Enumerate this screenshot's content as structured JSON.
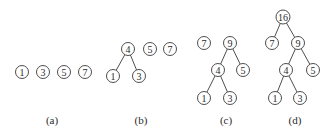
{
  "figure": {
    "panels": [
      {
        "id": "a",
        "caption": "(a)",
        "caption_pos": [
          52,
          124
        ],
        "nodes": [
          {
            "id": "a1",
            "label": "1",
            "x": 22,
            "y": 72
          },
          {
            "id": "a3",
            "label": "3",
            "x": 43,
            "y": 72
          },
          {
            "id": "a5",
            "label": "5",
            "x": 64,
            "y": 72
          },
          {
            "id": "a7",
            "label": "7",
            "x": 85,
            "y": 72
          }
        ],
        "edges": []
      },
      {
        "id": "b",
        "caption": "(b)",
        "caption_pos": [
          141,
          124
        ],
        "nodes": [
          {
            "id": "b4",
            "label": "4",
            "x": 128,
            "y": 49
          },
          {
            "id": "b5",
            "label": "5",
            "x": 150,
            "y": 49
          },
          {
            "id": "b7",
            "label": "7",
            "x": 170,
            "y": 49
          },
          {
            "id": "b1",
            "label": "1",
            "x": 113,
            "y": 76
          },
          {
            "id": "b3",
            "label": "3",
            "x": 139,
            "y": 76
          }
        ],
        "edges": [
          [
            "b4",
            "b1"
          ],
          [
            "b4",
            "b3"
          ]
        ]
      },
      {
        "id": "c",
        "caption": "(c)",
        "caption_pos": [
          226,
          124
        ],
        "nodes": [
          {
            "id": "c7",
            "label": "7",
            "x": 204,
            "y": 43
          },
          {
            "id": "c9",
            "label": "9",
            "x": 230,
            "y": 43
          },
          {
            "id": "c4",
            "label": "4",
            "x": 218,
            "y": 70
          },
          {
            "id": "c5",
            "label": "5",
            "x": 243,
            "y": 70
          },
          {
            "id": "c1",
            "label": "1",
            "x": 204,
            "y": 98
          },
          {
            "id": "c3",
            "label": "3",
            "x": 230,
            "y": 98
          }
        ],
        "edges": [
          [
            "c9",
            "c4"
          ],
          [
            "c9",
            "c5"
          ],
          [
            "c4",
            "c1"
          ],
          [
            "c4",
            "c3"
          ]
        ]
      },
      {
        "id": "d",
        "caption": "(d)",
        "caption_pos": [
          295,
          124
        ],
        "nodes": [
          {
            "id": "d16",
            "label": "16",
            "x": 283,
            "y": 17
          },
          {
            "id": "d7",
            "label": "7",
            "x": 272,
            "y": 43
          },
          {
            "id": "d9",
            "label": "9",
            "x": 298,
            "y": 43
          },
          {
            "id": "d4",
            "label": "4",
            "x": 286,
            "y": 70
          },
          {
            "id": "d5",
            "label": "5",
            "x": 313,
            "y": 70
          },
          {
            "id": "d1",
            "label": "1",
            "x": 275,
            "y": 98
          },
          {
            "id": "d3",
            "label": "3",
            "x": 300,
            "y": 98
          }
        ],
        "edges": [
          [
            "d16",
            "d7"
          ],
          [
            "d16",
            "d9"
          ],
          [
            "d9",
            "d4"
          ],
          [
            "d9",
            "d5"
          ],
          [
            "d4",
            "d1"
          ],
          [
            "d4",
            "d3"
          ]
        ]
      }
    ],
    "node_radius": 6.5
  }
}
